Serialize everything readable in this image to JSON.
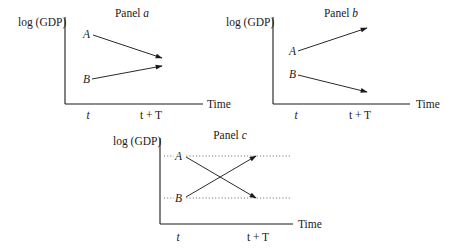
{
  "figure": {
    "y_axis_label": "log (GDP)",
    "x_axis_label": "Time",
    "x_ticks": [
      "t",
      "t + T"
    ],
    "panels": [
      {
        "id": "a",
        "title_prefix": "Panel ",
        "title_letter": "a",
        "points": [
          {
            "label": "A",
            "start_level": "high",
            "end_level": "mid-high",
            "direction": "down"
          },
          {
            "label": "B",
            "start_level": "low",
            "end_level": "mid-low",
            "direction": "up"
          }
        ],
        "description": "convergence: A falls, B rises toward each other"
      },
      {
        "id": "b",
        "title_prefix": "Panel ",
        "title_letter": "b",
        "points": [
          {
            "label": "A",
            "start_level": "mid-high",
            "end_level": "high",
            "direction": "up"
          },
          {
            "label": "B",
            "start_level": "mid-low",
            "end_level": "low",
            "direction": "down"
          }
        ],
        "description": "divergence: A rises, B falls"
      },
      {
        "id": "c",
        "title_prefix": "Panel ",
        "title_letter": "c",
        "points": [
          {
            "label": "A",
            "start_level": "high",
            "end_level": "low",
            "direction": "down"
          },
          {
            "label": "B",
            "start_level": "low",
            "end_level": "high",
            "direction": "up"
          }
        ],
        "reference_lines": [
          "dotted line at level of A",
          "dotted line at level of B"
        ],
        "description": "overtaking: A and B swap positions"
      }
    ]
  }
}
